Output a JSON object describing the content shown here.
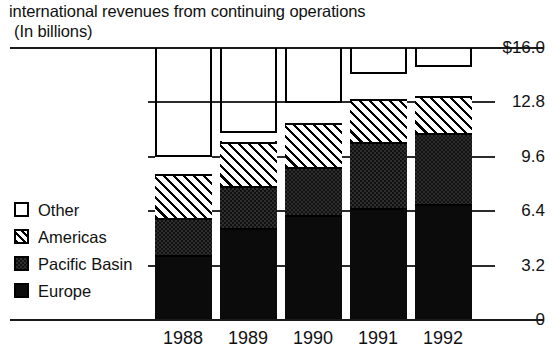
{
  "chart_data": {
    "type": "bar",
    "subtype": "stacked-vertical",
    "title": "international revenues from continuing operations",
    "subtitle": "(In billions)",
    "xlabel": "",
    "ylabel": "",
    "categories": [
      "1988",
      "1989",
      "1990",
      "1991",
      "1992"
    ],
    "series": [
      {
        "name": "Europe",
        "values": [
          3.8,
          5.4,
          6.2,
          6.6,
          6.8
        ]
      },
      {
        "name": "Pacific Basin",
        "values": [
          2.2,
          2.5,
          2.8,
          3.9,
          4.2
        ]
      },
      {
        "name": "Americas",
        "values": [
          2.6,
          2.6,
          2.6,
          2.5,
          2.2
        ]
      },
      {
        "name": "Other",
        "values": [
          1.1,
          0.6,
          1.3,
          1.6,
          1.8
        ]
      }
    ],
    "totals": [
      9.7,
      11.1,
      12.9,
      14.6,
      15.0
    ],
    "ylim": [
      0,
      16.0
    ],
    "ytick_labels": [
      "$16.0",
      "12.8",
      "9.6",
      "6.4",
      "3.2",
      "0"
    ],
    "ytick_values": [
      16.0,
      12.8,
      9.6,
      6.4,
      3.2,
      0
    ],
    "grid": true,
    "grid_axis": "y",
    "legend_position": "left-inside",
    "legend": [
      {
        "label": "Other",
        "pattern": "empty-white"
      },
      {
        "label": "Americas",
        "pattern": "diagonal-hatch"
      },
      {
        "label": "Pacific Basin",
        "pattern": "dark-dotted"
      },
      {
        "label": "Europe",
        "pattern": "solid-black"
      }
    ],
    "colors": {
      "other": "#ffffff",
      "americas": "#ffffff",
      "pacific_basin": "#2e2e2e",
      "europe": "#0b0b0b",
      "axis": "#1a1a1a",
      "text": "#111111",
      "background": "#ffffff"
    }
  }
}
